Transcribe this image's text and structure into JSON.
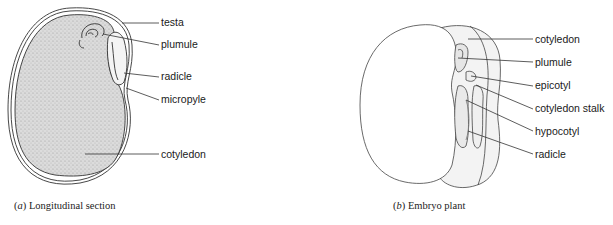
{
  "panel_a": {
    "caption_letter": "a",
    "caption_text": "Longitudinal section",
    "labels": [
      {
        "text": "testa",
        "x": 161,
        "y": 16
      },
      {
        "text": "plumule",
        "x": 161,
        "y": 38
      },
      {
        "text": "radicle",
        "x": 161,
        "y": 70
      },
      {
        "text": "micropyle",
        "x": 161,
        "y": 93
      },
      {
        "text": "cotyledon",
        "x": 161,
        "y": 148
      }
    ]
  },
  "panel_b": {
    "caption_letter": "b",
    "caption_text": "Embryo plant",
    "labels": [
      {
        "text": "cotyledon",
        "x": 535,
        "y": 33
      },
      {
        "text": "plumule",
        "x": 535,
        "y": 56
      },
      {
        "text": "epicotyl",
        "x": 535,
        "y": 79
      },
      {
        "text": "cotyledon stalk",
        "x": 535,
        "y": 102
      },
      {
        "text": "hypocotyl",
        "x": 535,
        "y": 125
      },
      {
        "text": "radicle",
        "x": 535,
        "y": 148
      }
    ]
  },
  "colors": {
    "line": "#333333",
    "stipple": "#cfcfcf",
    "embryo_fill": "#f1f1f1"
  }
}
